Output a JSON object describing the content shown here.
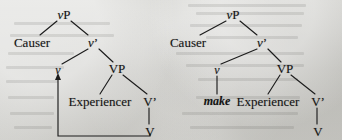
{
  "figure": {
    "type": "syntax-tree-pair",
    "background_color": "#cdcdc9",
    "ink_color": "#141414"
  },
  "trees": [
    {
      "id": "tree-left",
      "name": "covert-causative-tree",
      "nodes": [
        {
          "id": "vP",
          "label": "vP",
          "style": "italic-v",
          "x": 64,
          "y": 14
        },
        {
          "id": "Causer",
          "label": "Causer",
          "style": "plain",
          "x": 32,
          "y": 42
        },
        {
          "id": "vbar",
          "label": "v’",
          "style": "italic-v",
          "x": 93,
          "y": 42
        },
        {
          "id": "v",
          "label": "v",
          "style": "italic",
          "x": 58,
          "y": 70
        },
        {
          "id": "VP",
          "label": "VP",
          "style": "plain",
          "x": 117,
          "y": 68
        },
        {
          "id": "Experiencer",
          "label": "Experiencer",
          "style": "plain",
          "x": 100,
          "y": 101
        },
        {
          "id": "Vbar",
          "label": "V’",
          "style": "plain",
          "x": 150,
          "y": 101
        },
        {
          "id": "V",
          "label": "V",
          "style": "plain",
          "x": 150,
          "y": 131
        }
      ],
      "branches": [
        {
          "from": "vP",
          "to": "Causer"
        },
        {
          "from": "vP",
          "to": "vbar"
        },
        {
          "from": "vbar",
          "to": "v"
        },
        {
          "from": "vbar",
          "to": "VP"
        },
        {
          "from": "VP",
          "to": "Experiencer"
        },
        {
          "from": "VP",
          "to": "Vbar"
        },
        {
          "from": "Vbar",
          "to": "V"
        }
      ],
      "movement_arrow": {
        "name": "head-movement-V-to-v",
        "from": "V",
        "to": "v",
        "path": "L-shaped: down from V, left along baseline, up to v with arrowhead"
      }
    },
    {
      "id": "tree-right",
      "name": "overt-make-causative-tree",
      "nodes": [
        {
          "id": "vP",
          "label": "vP",
          "style": "italic-v",
          "x": 233,
          "y": 14
        },
        {
          "id": "Causer",
          "label": "Causer",
          "style": "plain",
          "x": 188,
          "y": 42
        },
        {
          "id": "vbar",
          "label": "v’",
          "style": "italic-v",
          "x": 262,
          "y": 42
        },
        {
          "id": "v",
          "label": "v",
          "style": "italic",
          "x": 217,
          "y": 70
        },
        {
          "id": "make",
          "label": "make",
          "style": "italic-bold",
          "x": 217,
          "y": 101
        },
        {
          "id": "VP",
          "label": "VP",
          "style": "plain",
          "x": 285,
          "y": 68
        },
        {
          "id": "Experiencer",
          "label": "Experiencer",
          "style": "plain",
          "x": 268,
          "y": 101
        },
        {
          "id": "Vbar",
          "label": "V’",
          "style": "plain",
          "x": 318,
          "y": 101
        },
        {
          "id": "V",
          "label": "V",
          "style": "plain",
          "x": 318,
          "y": 131
        }
      ],
      "branches": [
        {
          "from": "vP",
          "to": "Causer"
        },
        {
          "from": "vP",
          "to": "vbar"
        },
        {
          "from": "vbar",
          "to": "v"
        },
        {
          "from": "vbar",
          "to": "VP"
        },
        {
          "from": "v",
          "to": "make"
        },
        {
          "from": "VP",
          "to": "Experiencer"
        },
        {
          "from": "VP",
          "to": "Vbar"
        },
        {
          "from": "Vbar",
          "to": "V"
        }
      ],
      "movement_arrow": null
    }
  ],
  "labels": {
    "vP": "vP",
    "v_bar": "v’",
    "V_bar": "V’",
    "v": "v",
    "V": "V",
    "VP": "VP",
    "causer": "Causer",
    "experiencer": "Experiencer",
    "make": "make",
    "prime": "’"
  }
}
